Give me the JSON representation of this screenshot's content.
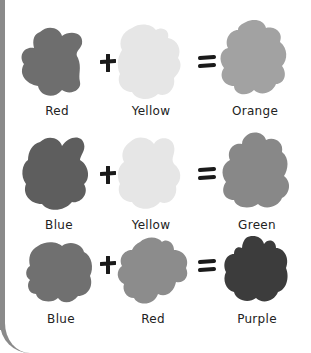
{
  "equations": [
    {
      "inputs": [
        {
          "name": "Red",
          "color": "#6e6e6e"
        },
        {
          "name": "Yellow",
          "color": "#e6e6e6"
        }
      ],
      "result": {
        "name": "Orange",
        "color": "#a2a2a2"
      },
      "operators": [
        "+",
        "="
      ]
    },
    {
      "inputs": [
        {
          "name": "Blue",
          "color": "#5e5e5e"
        },
        {
          "name": "Yellow",
          "color": "#e6e6e6"
        }
      ],
      "result": {
        "name": "Green",
        "color": "#888888"
      },
      "operators": [
        "+",
        "="
      ]
    },
    {
      "inputs": [
        {
          "name": "Blue",
          "color": "#707070"
        },
        {
          "name": "Red",
          "color": "#8c8c8c"
        }
      ],
      "result": {
        "name": "Purple",
        "color": "#3c3c3c"
      },
      "operators": [
        "+",
        "="
      ]
    }
  ],
  "colors": {
    "frame": "#8a8a8a",
    "operator": "#1a1a1a",
    "label": "#222222"
  }
}
